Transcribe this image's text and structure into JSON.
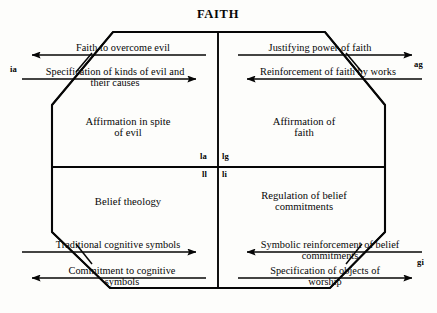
{
  "figure": {
    "title": "FAITH",
    "type": "agil-four-function-paradigm",
    "outer_shape": "chamfered-rectangle",
    "ink_color": "#060606",
    "background_color": "#fdfdfb"
  },
  "corner_codes": [
    {
      "id": "ia",
      "label": "ia",
      "position": "top-left"
    },
    {
      "id": "ag",
      "label": "ag",
      "position": "top-right"
    },
    {
      "id": "gi",
      "label": "gi",
      "position": "bottom-right"
    }
  ],
  "center_codes": [
    {
      "id": "la",
      "label": "la",
      "position": "upper-left-of-center"
    },
    {
      "id": "lg",
      "label": "lg",
      "position": "upper-right-of-center"
    },
    {
      "id": "ll",
      "label": "ll",
      "position": "lower-left-of-center"
    },
    {
      "id": "li",
      "label": "li",
      "position": "lower-right-of-center"
    }
  ],
  "quadrants": [
    {
      "id": "upper-left",
      "line1": "Affirmation in spite",
      "line2": "of evil"
    },
    {
      "id": "upper-right",
      "line1": "Affirmation of",
      "line2": "faith"
    },
    {
      "id": "lower-left",
      "line1": "Belief theology",
      "line2": ""
    },
    {
      "id": "lower-right",
      "line1": "Regulation of belief",
      "line2": "commitments"
    }
  ],
  "flows": [
    {
      "id": "top-left-outward",
      "line1": "Faith to overcome evil",
      "line2": "",
      "direction": "left"
    },
    {
      "id": "top-left-inward",
      "line1": "Specification of kinds of evil and",
      "line2": "their causes",
      "direction": "right"
    },
    {
      "id": "top-right-outward",
      "line1": "Justifying power of faith",
      "line2": "",
      "direction": "right"
    },
    {
      "id": "top-right-inward",
      "line1": "Reinforcement of faith by works",
      "line2": "",
      "direction": "left"
    },
    {
      "id": "bottom-left-inward",
      "line1": "Traditional cognitive symbols",
      "line2": "",
      "direction": "right"
    },
    {
      "id": "bottom-left-outward",
      "line1": "Commitment to cognitive",
      "line2": "symbols",
      "direction": "left"
    },
    {
      "id": "bottom-right-inward",
      "line1": "Symbolic reinforcement of belief",
      "line2": "commitments",
      "direction": "left"
    },
    {
      "id": "bottom-right-outward",
      "line1": "Specification of objects of",
      "line2": "worship",
      "direction": "right"
    }
  ]
}
